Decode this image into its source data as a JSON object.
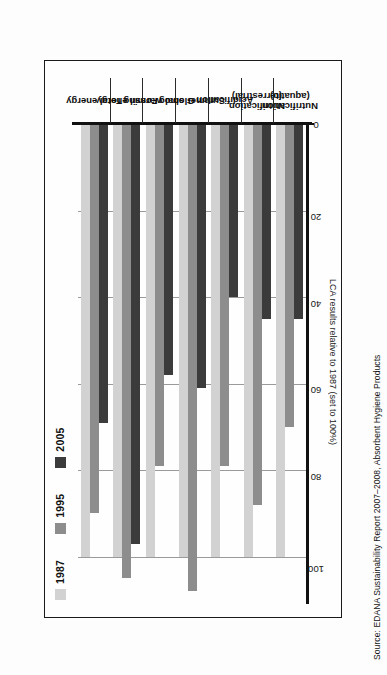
{
  "caption": "Source: EDANA Sustainability Report 2007–2008, Absorbent Hygiene Products",
  "legend": {
    "items": [
      {
        "label": "1987",
        "color": "#d2d2d2",
        "swatch_name": "legend-swatch-1987"
      },
      {
        "label": "1995",
        "color": "#8d8d8d",
        "swatch_name": "legend-swatch-1995"
      },
      {
        "label": "2005",
        "color": "#3b3b3b",
        "swatch_name": "legend-swatch-2005"
      }
    ]
  },
  "axis": {
    "title": "LCA results relative to 1987 (set to 100%)",
    "ticks": [
      "100",
      "80",
      "60",
      "40",
      "20",
      "0"
    ]
  },
  "chart_data": {
    "type": "bar",
    "orientation": "horizontal",
    "title": "",
    "subtitle": "",
    "xlabel": "LCA results relative to 1987 (set to 100%)",
    "ylabel": "",
    "xlim": [
      0,
      110
    ],
    "xticks": [
      0,
      20,
      40,
      60,
      80,
      100
    ],
    "grid": true,
    "legend_position": "top-left",
    "categories": [
      "Total energy",
      "Fossil energy",
      "Global warming",
      "Summer smog",
      "Acidification",
      "Nutrification (terrestrial)",
      "Nutrification (aquatic)"
    ],
    "series": [
      {
        "name": "1987",
        "color": "#d2d2d2",
        "values": [
          100,
          100,
          100,
          100,
          100,
          100,
          100
        ]
      },
      {
        "name": "1995",
        "color": "#8d8d8d",
        "values": [
          90,
          105,
          79,
          108,
          79,
          88,
          70
        ]
      },
      {
        "name": "2005",
        "color": "#3b3b3b",
        "values": [
          69,
          97,
          58,
          61,
          40,
          45,
          45
        ]
      }
    ]
  }
}
